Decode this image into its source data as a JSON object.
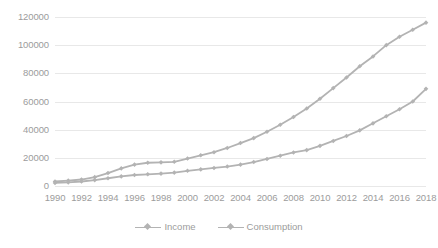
{
  "chart_data": {
    "type": "line",
    "title": "",
    "subtitle": "",
    "xlabel": "",
    "ylabel": "",
    "grid": true,
    "legend_position": "bottom",
    "ylim": [
      0,
      120000
    ],
    "ytick_labels": [
      "0",
      "20000",
      "40000",
      "60000",
      "80000",
      "100000",
      "120000"
    ],
    "ytick_values": [
      0,
      20000,
      40000,
      60000,
      80000,
      100000,
      120000
    ],
    "x": [
      1990,
      1991,
      1992,
      1993,
      1994,
      1995,
      1996,
      1997,
      1998,
      1999,
      2000,
      2001,
      2002,
      2003,
      2004,
      2005,
      2006,
      2007,
      2008,
      2009,
      2010,
      2011,
      2012,
      2013,
      2014,
      2015,
      2016,
      2017,
      2018
    ],
    "xtick_labels": [
      "1990",
      "1992",
      "1994",
      "1996",
      "1998",
      "2000",
      "2002",
      "2004",
      "2006",
      "2008",
      "2010",
      "2012",
      "2014",
      "2016",
      "2018"
    ],
    "xtick_values": [
      1990,
      1992,
      1994,
      1996,
      1998,
      2000,
      2002,
      2004,
      2006,
      2008,
      2010,
      2012,
      2014,
      2016,
      2018
    ],
    "series": [
      {
        "name": "Income",
        "color": "#b3b3b3",
        "marker": "diamond",
        "values": [
          3200,
          3800,
          4600,
          6300,
          9200,
          12500,
          15200,
          16500,
          16800,
          17200,
          19500,
          21800,
          24000,
          27000,
          30500,
          34000,
          38500,
          43500,
          49000,
          55000,
          62000,
          69500,
          77000,
          85000,
          92000,
          100000,
          106000,
          111000,
          116000
        ]
      },
      {
        "name": "Consumption",
        "color": "#b3b3b3",
        "marker": "diamond",
        "values": [
          2200,
          2600,
          3200,
          4200,
          5500,
          6800,
          7800,
          8300,
          8800,
          9500,
          10800,
          11800,
          12800,
          13800,
          15200,
          17000,
          19200,
          21500,
          23800,
          25500,
          28500,
          32000,
          35500,
          39500,
          44500,
          49500,
          54500,
          60000,
          69000
        ]
      }
    ]
  }
}
